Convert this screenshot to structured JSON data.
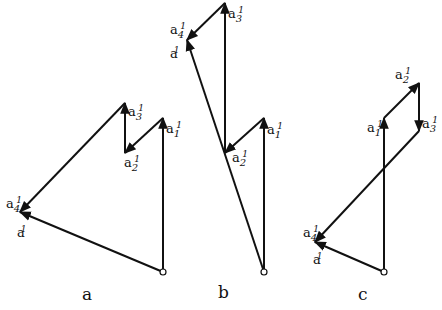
{
  "captions": {
    "a": "a",
    "b": "b",
    "c": "c"
  },
  "labels": {
    "base": "a",
    "prime": "1",
    "sub1": "1",
    "sub2": "2",
    "sub3": "3",
    "sub4": "4"
  },
  "figures": [
    {
      "id": "a",
      "points": [
        [
          163,
          272
        ],
        [
          163,
          118
        ],
        [
          125,
          153
        ],
        [
          125,
          103
        ],
        [
          20,
          212
        ]
      ],
      "closing_to": [
        20,
        212
      ]
    },
    {
      "id": "b",
      "points": [
        [
          264,
          272
        ],
        [
          264,
          118
        ],
        [
          225,
          153
        ],
        [
          225,
          3
        ],
        [
          187,
          40
        ]
      ],
      "closing_to": [
        187,
        40
      ]
    },
    {
      "id": "c",
      "points": [
        [
          384,
          272
        ],
        [
          384,
          118
        ],
        [
          419,
          83
        ],
        [
          419,
          131
        ],
        [
          315,
          242
        ]
      ],
      "closing_to": [
        315,
        242
      ]
    }
  ],
  "colors": {
    "stroke": "#111111",
    "background": "#ffffff"
  }
}
